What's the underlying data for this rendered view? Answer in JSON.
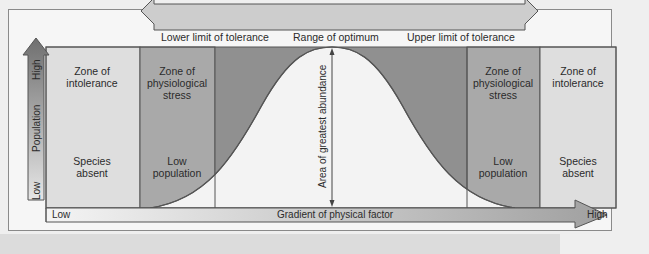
{
  "diagram": {
    "top_arrow": {
      "left_label": "Lower limit of tolerance",
      "center_label": "Range of optimum",
      "right_label": "Upper limit of tolerance"
    },
    "y_axis": {
      "label": "Population",
      "high": "High",
      "low": "Low"
    },
    "x_axis": {
      "label": "Gradient of physical factor",
      "low": "Low",
      "high": "High"
    },
    "center_annotation": "Area of greatest abundance",
    "zones": [
      {
        "id": "left-intolerance",
        "title_line1": "Zone of",
        "title_line2": "intolerance",
        "title_line3": "",
        "desc_line1": "Species",
        "desc_line2": "absent"
      },
      {
        "id": "left-stress",
        "title_line1": "Zone of",
        "title_line2": "physiological",
        "title_line3": "stress",
        "desc_line1": "Low",
        "desc_line2": "population"
      },
      {
        "id": "right-stress",
        "title_line1": "Zone of",
        "title_line2": "physiological",
        "title_line3": "stress",
        "desc_line1": "Low",
        "desc_line2": "population"
      },
      {
        "id": "right-intolerance",
        "title_line1": "Zone of",
        "title_line2": "intolerance",
        "title_line3": "",
        "desc_line1": "Species",
        "desc_line2": "absent"
      }
    ],
    "colors": {
      "intolerance": "#dedede",
      "stress": "#a9a9a9",
      "optimum_bg": "#8f8f8f",
      "curve_fill": "#f3f3f3",
      "arrow_fill": "#c9c9c9",
      "population_arrow_top": "#7d7d7d",
      "population_arrow_bottom": "#e0e0e0",
      "outline": "#555555"
    }
  }
}
